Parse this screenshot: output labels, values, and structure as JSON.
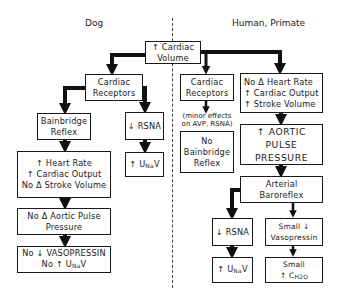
{
  "headers": {
    "left": "Dog",
    "right": "Human, Primate"
  },
  "root": {
    "lines": [
      "↑ Cardiac",
      "Volume"
    ]
  },
  "dog": {
    "receptors": {
      "lines": [
        "Cardiac",
        "Receptors"
      ]
    },
    "bainbridge": {
      "lines": [
        "Bainbridge",
        "Reflex"
      ]
    },
    "rsna": {
      "lines": [
        "↓ RSNA"
      ]
    },
    "unav": {
      "prefix": "↑ U",
      "sub": "Na",
      "suffix": "V"
    },
    "hemodynamics": {
      "lines": [
        "↑ Heart Rate",
        "↑ Cardiac Output",
        "No Δ Stroke Volume"
      ]
    },
    "pulse_pressure": {
      "lines": [
        "No Δ Aortic Pulse",
        "Pressure"
      ]
    },
    "vasopressin": {
      "line1": "No ↓ VASOPRESSIN",
      "line2_prefix": "No ↑ U",
      "line2_sub": "Na",
      "line2_suffix": "V"
    }
  },
  "human": {
    "receptors": {
      "lines": [
        "Cardiac",
        "Receptors"
      ]
    },
    "note": {
      "lines": [
        "(minor effects",
        "on AVP, RSNA)"
      ]
    },
    "no_bainbridge": {
      "lines": [
        "No",
        "Bainbridge",
        "Reflex"
      ]
    },
    "hemodynamics": {
      "lines": [
        "No Δ Heart Rate",
        "↑ Cardiac Output",
        "↑ Stroke Volume"
      ]
    },
    "pulse_pressure": {
      "lines": [
        "↑ AORTIC",
        "PULSE",
        "PRESSURE"
      ]
    },
    "baroreflex": {
      "lines": [
        "Arterial",
        "Baroreflex"
      ]
    },
    "rsna": {
      "lines": [
        "↓ RSNA"
      ]
    },
    "unav": {
      "prefix": "↑ U",
      "sub": "Na",
      "suffix": "V"
    },
    "vasopressin": {
      "lines": [
        "Small ↓",
        "Vasopressin"
      ]
    },
    "free_water": {
      "line1": "Small",
      "line2_prefix": "↑ C",
      "line2_sub": "H2O"
    }
  }
}
